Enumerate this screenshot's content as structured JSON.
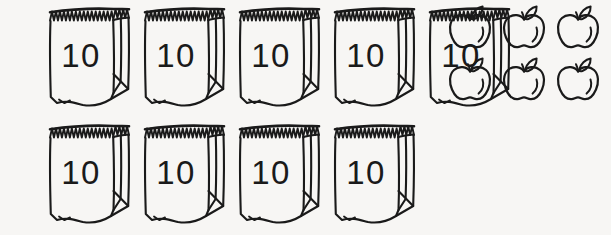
{
  "worksheet": {
    "title": "Base-ten bags and loose apples",
    "description": "Nine paper bags each labeled 10, plus six loose apples",
    "background_color": "#f7f6f4",
    "ink_color": "#1a1a1a"
  },
  "bags": {
    "label": "10",
    "group_name": "bags-of-ten",
    "total_count": 9,
    "rows": [
      {
        "row_name": "bag-row-top",
        "count": 5,
        "items": [
          {
            "name": "bag-1",
            "label": "10",
            "x": 45
          },
          {
            "name": "bag-2",
            "label": "10",
            "x": 140
          },
          {
            "name": "bag-3",
            "label": "10",
            "x": 235
          },
          {
            "name": "bag-4",
            "label": "10",
            "x": 330
          },
          {
            "name": "bag-5",
            "label": "10",
            "x": 425
          }
        ]
      },
      {
        "row_name": "bag-row-bottom",
        "count": 4,
        "items": [
          {
            "name": "bag-6",
            "label": "10",
            "x": 45
          },
          {
            "name": "bag-7",
            "label": "10",
            "x": 140
          },
          {
            "name": "bag-8",
            "label": "10",
            "x": 235
          },
          {
            "name": "bag-9",
            "label": "10",
            "x": 330
          }
        ]
      }
    ]
  },
  "apples": {
    "group_name": "loose-apples",
    "total_count": 6,
    "columns": 3,
    "rows": 2,
    "icon": "apple-icon",
    "items": [
      {
        "name": "apple-1",
        "x": 0,
        "y": 0
      },
      {
        "name": "apple-2",
        "x": 54,
        "y": 0
      },
      {
        "name": "apple-3",
        "x": 108,
        "y": 0
      },
      {
        "name": "apple-4",
        "x": 0,
        "y": 52
      },
      {
        "name": "apple-5",
        "x": 54,
        "y": 52
      },
      {
        "name": "apple-6",
        "x": 108,
        "y": 52
      }
    ]
  },
  "chart_data": {
    "type": "table",
    "categories": [
      "Bags of ten",
      "Loose apples"
    ],
    "values": [
      9,
      6
    ],
    "unit_per_bag": 10,
    "total": 96
  }
}
